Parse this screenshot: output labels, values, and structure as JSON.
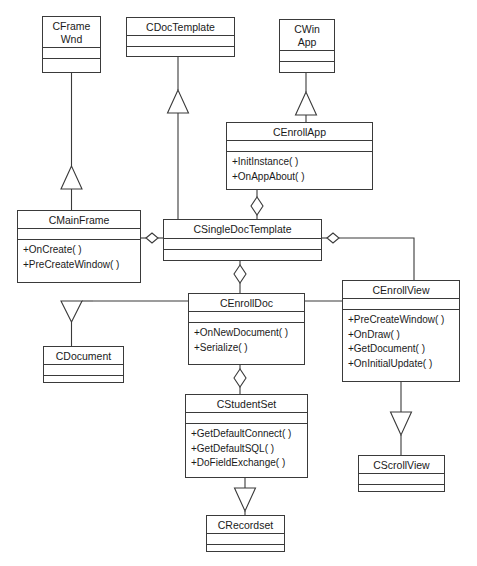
{
  "diagram": {
    "type": "uml-class-diagram",
    "canvas": {
      "width": 477,
      "height": 566
    },
    "colors": {
      "line": "#3a3a3a",
      "text": "#1a1a1a",
      "background": "#ffffff"
    }
  },
  "classes": [
    {
      "id": "cframewnd",
      "name": "CFrame\nWnd",
      "x": 42,
      "y": 16,
      "w": 59,
      "h": 57,
      "name_h": 31,
      "attributes": [],
      "operations": []
    },
    {
      "id": "cdoctemplate",
      "name": "CDocTemplate",
      "x": 126,
      "y": 17,
      "w": 109,
      "h": 40,
      "name_h": 18,
      "attributes": [],
      "operations": []
    },
    {
      "id": "cwinapp",
      "name": "CWin\nApp",
      "x": 279,
      "y": 19,
      "w": 56,
      "h": 54,
      "name_h": 31,
      "attributes": [],
      "operations": []
    },
    {
      "id": "cenrollapp",
      "name": "CEnrollApp",
      "x": 226,
      "y": 122,
      "w": 147,
      "h": 68,
      "name_h": 18,
      "attributes": [],
      "operations": [
        "+InitInstance( )",
        "+OnAppAbout( )"
      ]
    },
    {
      "id": "cmainframe",
      "name": "CMainFrame",
      "x": 17,
      "y": 210,
      "w": 124,
      "h": 73,
      "name_h": 18,
      "attributes": [],
      "operations": [
        "+OnCreate( )",
        "+PreCreateWindow( )"
      ]
    },
    {
      "id": "csingledoctemplate",
      "name": "CSingleDocTemplate",
      "x": 163,
      "y": 219,
      "w": 159,
      "h": 42,
      "name_h": 19,
      "attributes": [],
      "operations": []
    },
    {
      "id": "cenrollview",
      "name": "CEnrollView",
      "x": 342,
      "y": 280,
      "w": 118,
      "h": 102,
      "name_h": 18,
      "attributes": [],
      "operations": [
        "+PreCreateWindow( )",
        "+OnDraw( )",
        "+GetDocument( )",
        "+OnInitialUpdate( )"
      ]
    },
    {
      "id": "cenrolldoc",
      "name": "CEnrollDoc",
      "x": 188,
      "y": 293,
      "w": 117,
      "h": 72,
      "name_h": 18,
      "attributes": [],
      "operations": [
        "+OnNewDocument( )",
        "+Serialize( )"
      ]
    },
    {
      "id": "cdocument",
      "name": "CDocument",
      "x": 43,
      "y": 346,
      "w": 81,
      "h": 37,
      "name_h": 18,
      "attributes": [],
      "operations": []
    },
    {
      "id": "cstudentset",
      "name": "CStudentSet",
      "x": 185,
      "y": 394,
      "w": 123,
      "h": 84,
      "name_h": 18,
      "attributes": [],
      "operations": [
        "+GetDefaultConnect( )",
        "+GetDefaultSQL( )",
        "+DoFieldExchange( )"
      ]
    },
    {
      "id": "cscrollview",
      "name": "CScrollView",
      "x": 358,
      "y": 455,
      "w": 87,
      "h": 37,
      "name_h": 18,
      "attributes": [],
      "operations": []
    },
    {
      "id": "crecordset",
      "name": "CRecordset",
      "x": 206,
      "y": 515,
      "w": 79,
      "h": 37,
      "name_h": 18,
      "attributes": [],
      "operations": []
    }
  ],
  "relationships": [
    {
      "id": "r1",
      "kind": "generalization",
      "from": "cmainframe",
      "to": "cframewnd",
      "label": ""
    },
    {
      "id": "r2",
      "kind": "generalization",
      "from": "csingledoctemplate",
      "to": "cdoctemplate",
      "label": ""
    },
    {
      "id": "r3",
      "kind": "generalization",
      "from": "cenrollapp",
      "to": "cwinapp",
      "label": ""
    },
    {
      "id": "r4",
      "kind": "generalization",
      "from": "cenrolldoc",
      "to": "cdocument",
      "label": ""
    },
    {
      "id": "r5",
      "kind": "generalization",
      "from": "cstudentset",
      "to": "crecordset",
      "label": ""
    },
    {
      "id": "r6",
      "kind": "generalization",
      "from": "cenrollview",
      "to": "cscrollview",
      "label": ""
    },
    {
      "id": "r7",
      "kind": "aggregation",
      "from": "cenrollapp",
      "to": "csingledoctemplate",
      "label": ""
    },
    {
      "id": "r8",
      "kind": "aggregation",
      "from": "csingledoctemplate",
      "to": "cmainframe",
      "label": ""
    },
    {
      "id": "r9",
      "kind": "aggregation",
      "from": "csingledoctemplate",
      "to": "cenrollview",
      "label": ""
    },
    {
      "id": "r10",
      "kind": "aggregation",
      "from": "csingledoctemplate",
      "to": "cenrolldoc",
      "label": ""
    },
    {
      "id": "r11",
      "kind": "aggregation",
      "from": "cenrolldoc",
      "to": "cstudentset",
      "label": ""
    }
  ]
}
